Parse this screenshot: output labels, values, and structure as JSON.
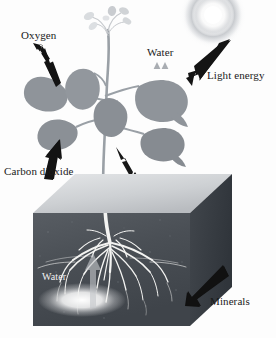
{
  "figure": {
    "background_color": "#fdfdfd"
  },
  "labels": {
    "oxygen": "Oxygen",
    "water_leaf": "Water",
    "light_energy": "Light energy",
    "carbon_dioxide": "Carbon dioxide",
    "water_soil": "Water",
    "minerals": "Minerals"
  },
  "colors": {
    "arrow_dark": "#141414",
    "arrow_light": "#b9bcc0",
    "leaf": "#8f949a",
    "leaf_dark": "#82878d",
    "stem": "#9aa0a6",
    "flower": "#d3d6d9",
    "soil_front": "#4a4f55",
    "soil_right": "#3b4046",
    "soil_top": "#c9ccd0",
    "root": "#f4f4f2",
    "sun_glow": "#d8dadd",
    "label_text": "#1a1a1a",
    "label_text_light": "#f2f2f2"
  },
  "elements": {
    "sun": "sun-glow",
    "plant": "plant-silhouette",
    "flowers": "flower-buds",
    "soil_block": "soil-block",
    "roots": "root-system",
    "water_glow": "water-glow"
  },
  "arrows": {
    "oxygen": {
      "name": "oxygen-arrow",
      "direction": "up-left",
      "color": "dark"
    },
    "light_energy": {
      "name": "light-energy-arrow",
      "direction": "down-left",
      "color": "dark"
    },
    "carbon_dioxide": {
      "name": "carbon-dioxide-arrow",
      "direction": "up-right",
      "color": "dark"
    },
    "stem_down": {
      "name": "stem-down-arrow",
      "direction": "down",
      "color": "dark"
    },
    "water_vapor_1": {
      "name": "water-vapor-arrow-left",
      "direction": "up",
      "color": "light"
    },
    "water_vapor_2": {
      "name": "water-vapor-arrow-right",
      "direction": "up",
      "color": "light"
    },
    "water_uptake": {
      "name": "water-uptake-arrow",
      "direction": "up",
      "color": "light"
    },
    "minerals": {
      "name": "minerals-arrow",
      "direction": "down-left",
      "color": "dark"
    }
  }
}
